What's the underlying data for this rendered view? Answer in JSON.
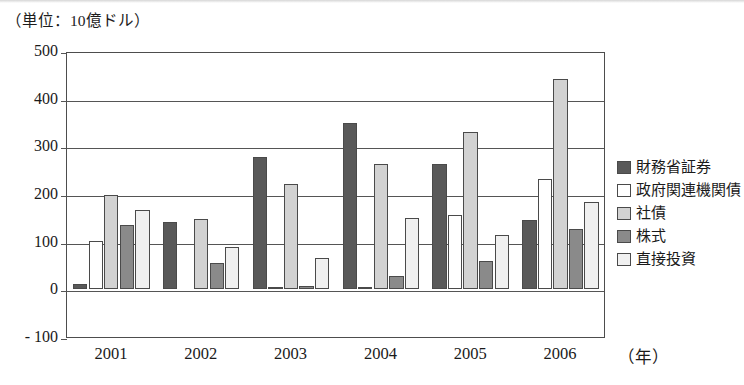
{
  "unit_caption": "（単位：10億ドル）",
  "x_axis_unit": "（年）",
  "chart_data": {
    "type": "bar",
    "title": "",
    "subtitle": "",
    "xlabel": "（年）",
    "ylabel": "（単位：10億ドル）",
    "categories": [
      "2001",
      "2002",
      "2003",
      "2004",
      "2005",
      "2006"
    ],
    "ylim": [
      -100,
      500
    ],
    "yticks": [
      "500",
      "400",
      "300",
      "200",
      "100",
      "0",
      "- 100"
    ],
    "ytick_values": [
      500,
      400,
      300,
      200,
      100,
      0,
      -100
    ],
    "grid": true,
    "grid_axis": "y",
    "legend_position": "right",
    "series": [
      {
        "name": "財務省証券",
        "color": "#595959",
        "values": [
          11,
          141,
          278,
          348,
          263,
          145
        ]
      },
      {
        "name": "政府関連機関債",
        "color": "#ffffff",
        "values": [
          102,
          0,
          3,
          2,
          155,
          232
        ]
      },
      {
        "name": "社債",
        "color": "#d2d2d2",
        "values": [
          197,
          148,
          222,
          262,
          331,
          442
        ]
      },
      {
        "name": "株式",
        "color": "#8a8a8a",
        "values": [
          135,
          55,
          8,
          27,
          60,
          127
        ]
      },
      {
        "name": "直接投資",
        "color": "#f0f0f0",
        "values": [
          167,
          88,
          65,
          150,
          113,
          184
        ]
      }
    ]
  },
  "legend": {
    "items": [
      {
        "label": "財務省証券",
        "color": "#595959"
      },
      {
        "label": "政府関連機関債",
        "color": "#ffffff"
      },
      {
        "label": "社債",
        "color": "#d2d2d2"
      },
      {
        "label": "株式",
        "color": "#8a8a8a"
      },
      {
        "label": "直接投資",
        "color": "#f0f0f0"
      }
    ]
  }
}
